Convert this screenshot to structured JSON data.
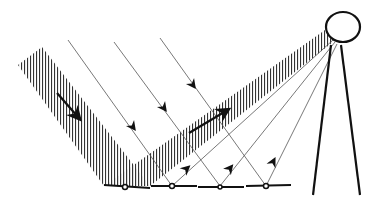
{
  "diagram": {
    "title": "Solar power tower with heliostat mirror field",
    "colors": {
      "ink": "#111111",
      "ray": "#555555",
      "hatch": "#333333",
      "background": "#ffffff"
    },
    "incident_beam": {
      "direction": "down-right",
      "label": "incoming sunlight band"
    },
    "reflected_beam": {
      "direction": "up-right toward receiver",
      "label": "reflected concentrated light"
    },
    "incident_rays": [
      {
        "start": [
          68,
          40
        ],
        "end": [
          172,
          186
        ]
      },
      {
        "start": [
          114,
          42
        ],
        "end": [
          220,
          186
        ]
      },
      {
        "start": [
          160,
          38
        ],
        "end": [
          266,
          186
        ]
      }
    ],
    "reflected_rays": [
      {
        "start": [
          172,
          186
        ],
        "end": [
          333,
          40
        ]
      },
      {
        "start": [
          220,
          186
        ],
        "end": [
          335,
          42
        ]
      },
      {
        "start": [
          266,
          186
        ],
        "end": [
          337,
          44
        ]
      }
    ],
    "mirrors": [
      {
        "x1": 104,
        "x2": 150,
        "pivot": [
          125,
          187
        ]
      },
      {
        "x1": 150,
        "x2": 197,
        "pivot": [
          172,
          186
        ]
      },
      {
        "x1": 198,
        "x2": 244,
        "pivot": [
          220,
          187
        ]
      },
      {
        "x1": 246,
        "x2": 291,
        "pivot": [
          266,
          186
        ]
      }
    ],
    "receiver": {
      "center": [
        343,
        27
      ],
      "rx": 17,
      "ry": 15
    },
    "tower": {
      "left_leg": [
        [
          331,
          45
        ],
        [
          313,
          195
        ]
      ],
      "right_leg": [
        [
          341,
          45
        ],
        [
          360,
          195
        ]
      ]
    }
  }
}
